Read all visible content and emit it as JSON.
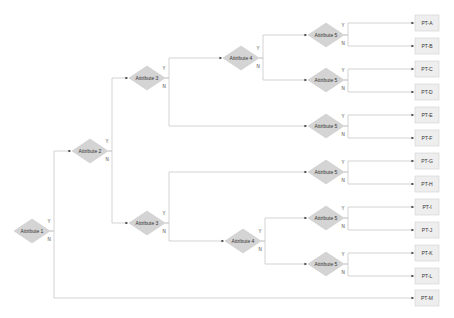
{
  "diagram": {
    "type": "decision-tree",
    "colors": {
      "node_fill": "#d4d4d4",
      "leaf_fill": "#eeeeee",
      "edge": "#c8c8c8",
      "text": "#333333"
    },
    "decision_nodes": [
      {
        "id": "a1",
        "label": "Attribute 1",
        "x": 32,
        "y": 231
      },
      {
        "id": "a2",
        "label": "Attribute 2",
        "x": 90,
        "y": 151
      },
      {
        "id": "a3t",
        "label": "Attribute 3",
        "x": 147,
        "y": 78
      },
      {
        "id": "a3b",
        "label": "Attribute 3",
        "x": 147,
        "y": 223
      },
      {
        "id": "a4t",
        "label": "Attribute 4",
        "x": 241,
        "y": 58
      },
      {
        "id": "a4b",
        "label": "Attribute 4",
        "x": 243,
        "y": 241
      },
      {
        "id": "a5a",
        "label": "Attribute 5",
        "x": 326,
        "y": 35
      },
      {
        "id": "a5b",
        "label": "Attribute 5",
        "x": 326,
        "y": 80
      },
      {
        "id": "a5c",
        "label": "Attribute 5",
        "x": 326,
        "y": 126
      },
      {
        "id": "a5d",
        "label": "Attribute 5",
        "x": 326,
        "y": 172
      },
      {
        "id": "a5e",
        "label": "Attribute 5",
        "x": 326,
        "y": 218
      },
      {
        "id": "a5f",
        "label": "Attribute 5",
        "x": 326,
        "y": 264
      }
    ],
    "leaf_nodes": [
      {
        "id": "pta",
        "label": "PT-A",
        "x": 427,
        "y": 23
      },
      {
        "id": "ptb",
        "label": "PT-B",
        "x": 427,
        "y": 46
      },
      {
        "id": "ptc",
        "label": "PT-C",
        "x": 427,
        "y": 69
      },
      {
        "id": "ptd",
        "label": "PT-D",
        "x": 427,
        "y": 92
      },
      {
        "id": "pte",
        "label": "PT-E",
        "x": 427,
        "y": 115
      },
      {
        "id": "ptf",
        "label": "PT-F",
        "x": 427,
        "y": 138
      },
      {
        "id": "ptg",
        "label": "PT-G",
        "x": 427,
        "y": 161
      },
      {
        "id": "pth",
        "label": "PT-H",
        "x": 427,
        "y": 184
      },
      {
        "id": "pti",
        "label": "PT-I",
        "x": 427,
        "y": 207
      },
      {
        "id": "ptj",
        "label": "PT-J",
        "x": 427,
        "y": 230
      },
      {
        "id": "ptk",
        "label": "PT-K",
        "x": 427,
        "y": 253
      },
      {
        "id": "ptl",
        "label": "PT-L",
        "x": 427,
        "y": 276
      },
      {
        "id": "ptm",
        "label": "PT-M",
        "x": 427,
        "y": 298
      }
    ],
    "edges": [
      {
        "from": "a1",
        "to": "a2",
        "label": "Y"
      },
      {
        "from": "a1",
        "to": "ptm",
        "label": "N"
      },
      {
        "from": "a2",
        "to": "a3t",
        "label": "Y"
      },
      {
        "from": "a2",
        "to": "a3b",
        "label": "N"
      },
      {
        "from": "a3t",
        "to": "a4t",
        "label": "Y"
      },
      {
        "from": "a3t",
        "to": "a5c",
        "label": "N"
      },
      {
        "from": "a3b",
        "to": "a5d",
        "label": "Y"
      },
      {
        "from": "a3b",
        "to": "a4b",
        "label": "N"
      },
      {
        "from": "a4t",
        "to": "a5a",
        "label": "Y"
      },
      {
        "from": "a4t",
        "to": "a5b",
        "label": "N"
      },
      {
        "from": "a4b",
        "to": "a5e",
        "label": "Y"
      },
      {
        "from": "a4b",
        "to": "a5f",
        "label": "N"
      },
      {
        "from": "a5a",
        "to": "pta",
        "label": "Y"
      },
      {
        "from": "a5a",
        "to": "ptb",
        "label": "N"
      },
      {
        "from": "a5b",
        "to": "ptc",
        "label": "Y"
      },
      {
        "from": "a5b",
        "to": "ptd",
        "label": "N"
      },
      {
        "from": "a5c",
        "to": "pte",
        "label": "Y"
      },
      {
        "from": "a5c",
        "to": "ptf",
        "label": "N"
      },
      {
        "from": "a5d",
        "to": "ptg",
        "label": "Y"
      },
      {
        "from": "a5d",
        "to": "pth",
        "label": "N"
      },
      {
        "from": "a5e",
        "to": "pti",
        "label": "Y"
      },
      {
        "from": "a5e",
        "to": "ptj",
        "label": "N"
      },
      {
        "from": "a5f",
        "to": "ptk",
        "label": "Y"
      },
      {
        "from": "a5f",
        "to": "ptl",
        "label": "N"
      }
    ]
  }
}
